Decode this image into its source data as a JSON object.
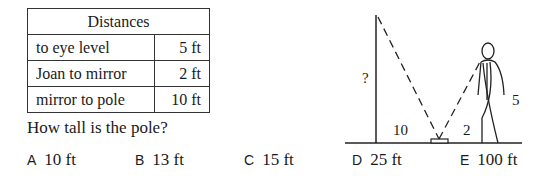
{
  "table": {
    "header": "Distances",
    "rows": [
      {
        "label": "to eye level",
        "value": "5 ft"
      },
      {
        "label": "Joan to mirror",
        "value": "2 ft"
      },
      {
        "label": "mirror to pole",
        "value": "10 ft"
      }
    ]
  },
  "question": "How tall is the pole?",
  "choices": [
    {
      "letter": "A",
      "text": "10 ft"
    },
    {
      "letter": "B",
      "text": "13 ft"
    },
    {
      "letter": "C",
      "text": "15 ft"
    },
    {
      "letter": "D",
      "text": "25 ft"
    },
    {
      "letter": "E",
      "text": "100 ft"
    }
  ],
  "figure": {
    "pole_label": "?",
    "mirror_to_pole_label": "10",
    "joan_to_mirror_label": "2",
    "eye_height_label": "5"
  }
}
